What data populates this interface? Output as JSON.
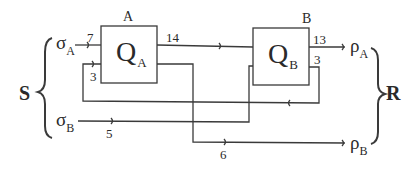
{
  "diagram": {
    "left_group": {
      "label": "S",
      "inputs": [
        {
          "symbol": "σ",
          "sub": "A"
        },
        {
          "symbol": "σ",
          "sub": "B"
        }
      ]
    },
    "right_group": {
      "label": "R",
      "outputs": [
        {
          "symbol": "ρ",
          "sub": "A"
        },
        {
          "symbol": "ρ",
          "sub": "B"
        }
      ]
    },
    "nodes": [
      {
        "id": "A",
        "label": "A",
        "queue": "Q",
        "queue_sub": "A"
      },
      {
        "id": "B",
        "label": "B",
        "queue": "Q",
        "queue_sub": "B"
      }
    ],
    "edges": [
      {
        "from": "σA",
        "to": "A",
        "rate": "7"
      },
      {
        "from": "B",
        "to": "A",
        "rate": "3",
        "note": "feedback"
      },
      {
        "from": "A",
        "to": "B",
        "rate": "14"
      },
      {
        "from": "B",
        "to": "ρA",
        "rate": "13"
      },
      {
        "from": "B",
        "to": "A",
        "rate": "3",
        "note": "B output"
      },
      {
        "from": "σB",
        "to": "B",
        "rate": "5"
      },
      {
        "from": "A",
        "to": "ρB",
        "rate": "6"
      }
    ],
    "colors": {
      "line": "#3a3a3a",
      "text": "#2a2a2a",
      "background": "#ffffff"
    }
  }
}
